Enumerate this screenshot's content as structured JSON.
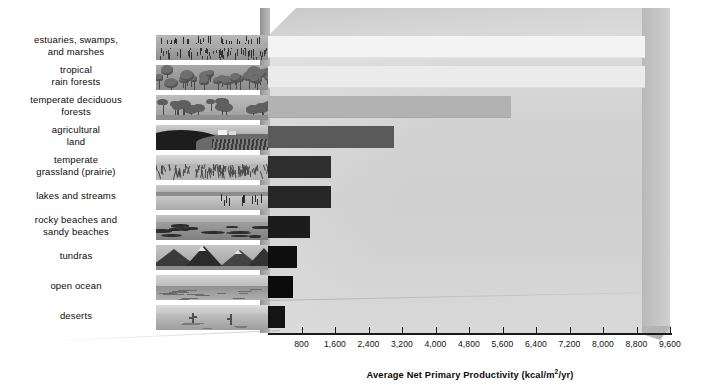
{
  "chart_data": {
    "type": "bar",
    "orientation": "horizontal",
    "title": "",
    "xlabel": "Average Net Primary Productivity (kcal/m²/yr)",
    "ylabel": "",
    "xlim": [
      0,
      9900
    ],
    "xticks": [
      800,
      1600,
      2400,
      3200,
      4000,
      4800,
      5600,
      6400,
      7200,
      8000,
      8800,
      9600
    ],
    "xtick_labels": [
      "800",
      "1,600",
      "2,400",
      "3,200",
      "4,000",
      "4,800",
      "5,600",
      "6,400",
      "7,200",
      "8,000",
      "8,800",
      "9,600"
    ],
    "grid": false,
    "legend": "none",
    "categories": [
      "estuaries, swamps, and marshes",
      "tropical rain forests",
      "temperate deciduous forests",
      "agricultural land",
      "temperate grassland (prairie)",
      "lakes and streams",
      "rocky beaches and sandy beaches",
      "tundras",
      "open ocean",
      "deserts"
    ],
    "values": [
      9000,
      9000,
      5800,
      3000,
      1500,
      1500,
      1000,
      700,
      600,
      400
    ]
  },
  "rows": [
    {
      "label_line1": "estuaries, swamps,",
      "label_line2": "and marshes",
      "value": 9000,
      "color": "#f3f3f3",
      "scene": "marsh"
    },
    {
      "label_line1": "tropical",
      "label_line2": "rain forests",
      "value": 9000,
      "color": "#ebebeb",
      "scene": "rainforest"
    },
    {
      "label_line1": "temperate deciduous",
      "label_line2": "forests",
      "value": 5800,
      "color": "#b2b2b2",
      "scene": "deciduous"
    },
    {
      "label_line1": "agricultural",
      "label_line2": "land",
      "value": 3000,
      "color": "#5a5a5a",
      "scene": "farm"
    },
    {
      "label_line1": "temperate",
      "label_line2": "grassland (prairie)",
      "value": 1500,
      "color": "#2e2e2e",
      "scene": "prairie"
    },
    {
      "label_line1": "lakes and streams",
      "label_line2": "",
      "value": 1500,
      "color": "#262626",
      "scene": "lake"
    },
    {
      "label_line1": "rocky beaches and",
      "label_line2": "sandy beaches",
      "value": 1000,
      "color": "#1c1c1c",
      "scene": "beach"
    },
    {
      "label_line1": "tundras",
      "label_line2": "",
      "value": 700,
      "color": "#0f0f0f",
      "scene": "tundra"
    },
    {
      "label_line1": "open ocean",
      "label_line2": "",
      "value": 600,
      "color": "#0b0b0b",
      "scene": "ocean"
    },
    {
      "label_line1": "deserts",
      "label_line2": "",
      "value": 400,
      "color": "#141414",
      "scene": "desert"
    }
  ],
  "axis": {
    "title": "Average Net Primary Productivity (kcal/m",
    "title_sup": "2",
    "title_tail": "/yr)",
    "ticks": [
      "800",
      "1,600",
      "2,400",
      "3,200",
      "4,000",
      "4,800",
      "5,600",
      "6,400",
      "7,200",
      "8,000",
      "8,800",
      "9,600"
    ]
  },
  "colors": {
    "axis": "#1a1a1a",
    "text": "#0b0b0b",
    "box_face": "#d4d4d4",
    "box_top": "#d6d6d6",
    "box_right": "#c2c2c2"
  }
}
